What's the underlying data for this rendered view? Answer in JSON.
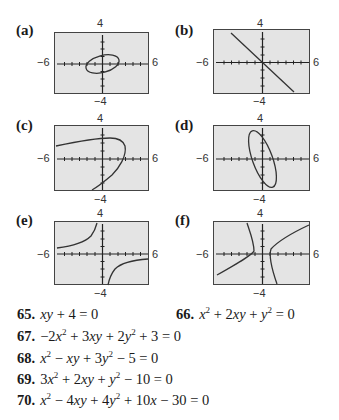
{
  "panels": [
    {
      "label": "(a)",
      "xmin": "−6",
      "xmax": "6",
      "ymax": "4",
      "ymin": "−4",
      "curve": "tilted ellipse (small, positive slope)"
    },
    {
      "label": "(b)",
      "xmin": "−6",
      "xmax": "6",
      "ymax": "4",
      "ymin": "−4",
      "curve": "line y = −x"
    },
    {
      "label": "(c)",
      "xmin": "−6",
      "xmax": "6",
      "ymax": "4",
      "ymin": "−4",
      "curve": "parabola opening left"
    },
    {
      "label": "(d)",
      "xmin": "−6",
      "xmax": "6",
      "ymax": "4",
      "ymin": "−4",
      "curve": "tilted ellipse (tall, negative slope)"
    },
    {
      "label": "(e)",
      "xmin": "−6",
      "xmax": "6",
      "ymax": "4",
      "ymin": "−4",
      "curve": "hyperbola xy = −4"
    },
    {
      "label": "(f)",
      "xmin": "−6",
      "xmax": "6",
      "ymax": "4",
      "ymin": "−4",
      "curve": "rotated hyperbola"
    }
  ],
  "exercises": [
    {
      "num": "65.",
      "html": "xy + 4 = 0"
    },
    {
      "num": "66.",
      "html": "x² + 2xy + y² = 0"
    },
    {
      "num": "67.",
      "html": "−2x² + 3xy + 2y² + 3 = 0"
    },
    {
      "num": "68.",
      "html": "x² − xy + 3y² − 5 = 0"
    },
    {
      "num": "69.",
      "html": "3x² + 2xy + y² − 10 = 0"
    },
    {
      "num": "70.",
      "html": "x² − 4xy + 4y² + 10x − 30 = 0"
    }
  ],
  "colors": {
    "plot_bg": "#e4e4e4",
    "curve": "#333333",
    "axis": "#222222"
  }
}
